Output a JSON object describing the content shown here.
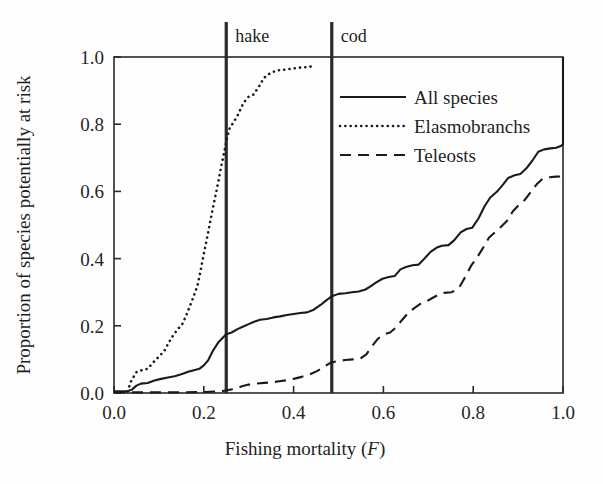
{
  "chart_data": {
    "type": "line",
    "title": "",
    "xlabel": "Fishing mortality (F)",
    "ylabel": "Proportion of species potentially at risk",
    "xlim": [
      0.0,
      1.0
    ],
    "ylim": [
      0.0,
      1.0
    ],
    "grid": false,
    "legend_position": "upper-right-inside",
    "xticks": [
      "0.0",
      "0.2",
      "0.4",
      "0.6",
      "0.8",
      "1.0"
    ],
    "xtick_values": [
      0.0,
      0.2,
      0.4,
      0.6,
      0.8,
      1.0
    ],
    "yticks": [
      "0.0",
      "0.2",
      "0.4",
      "0.6",
      "0.8",
      "1.0"
    ],
    "ytick_values": [
      0.0,
      0.2,
      0.4,
      0.6,
      0.8,
      1.0
    ],
    "annotations": [
      {
        "label": "hake",
        "x": 0.25,
        "type": "vertical-reference-line",
        "color": "#2b2b2b"
      },
      {
        "label": "cod",
        "x": 0.485,
        "type": "vertical-reference-line",
        "color": "#2b2b2b"
      }
    ],
    "series": [
      {
        "name": "All species",
        "style": "solid",
        "color": "#1a1a1a",
        "points": [
          [
            0.0,
            0.005
          ],
          [
            0.03,
            0.005
          ],
          [
            0.04,
            0.01
          ],
          [
            0.05,
            0.022
          ],
          [
            0.06,
            0.028
          ],
          [
            0.075,
            0.03
          ],
          [
            0.09,
            0.037
          ],
          [
            0.105,
            0.042
          ],
          [
            0.12,
            0.046
          ],
          [
            0.135,
            0.05
          ],
          [
            0.15,
            0.056
          ],
          [
            0.165,
            0.063
          ],
          [
            0.178,
            0.068
          ],
          [
            0.19,
            0.072
          ],
          [
            0.2,
            0.082
          ],
          [
            0.21,
            0.098
          ],
          [
            0.22,
            0.125
          ],
          [
            0.232,
            0.15
          ],
          [
            0.245,
            0.168
          ],
          [
            0.25,
            0.175
          ],
          [
            0.262,
            0.18
          ],
          [
            0.275,
            0.19
          ],
          [
            0.288,
            0.198
          ],
          [
            0.3,
            0.205
          ],
          [
            0.312,
            0.212
          ],
          [
            0.325,
            0.218
          ],
          [
            0.34,
            0.22
          ],
          [
            0.355,
            0.225
          ],
          [
            0.37,
            0.228
          ],
          [
            0.385,
            0.232
          ],
          [
            0.4,
            0.235
          ],
          [
            0.415,
            0.238
          ],
          [
            0.43,
            0.24
          ],
          [
            0.445,
            0.248
          ],
          [
            0.46,
            0.262
          ],
          [
            0.472,
            0.275
          ],
          [
            0.485,
            0.288
          ],
          [
            0.5,
            0.295
          ],
          [
            0.515,
            0.297
          ],
          [
            0.53,
            0.3
          ],
          [
            0.545,
            0.302
          ],
          [
            0.56,
            0.308
          ],
          [
            0.572,
            0.318
          ],
          [
            0.585,
            0.33
          ],
          [
            0.598,
            0.34
          ],
          [
            0.612,
            0.345
          ],
          [
            0.625,
            0.348
          ],
          [
            0.638,
            0.368
          ],
          [
            0.65,
            0.375
          ],
          [
            0.665,
            0.38
          ],
          [
            0.678,
            0.382
          ],
          [
            0.69,
            0.398
          ],
          [
            0.705,
            0.42
          ],
          [
            0.718,
            0.432
          ],
          [
            0.73,
            0.438
          ],
          [
            0.745,
            0.44
          ],
          [
            0.758,
            0.455
          ],
          [
            0.772,
            0.478
          ],
          [
            0.785,
            0.488
          ],
          [
            0.798,
            0.492
          ],
          [
            0.812,
            0.52
          ],
          [
            0.825,
            0.555
          ],
          [
            0.838,
            0.582
          ],
          [
            0.852,
            0.598
          ],
          [
            0.865,
            0.618
          ],
          [
            0.878,
            0.64
          ],
          [
            0.892,
            0.648
          ],
          [
            0.905,
            0.652
          ],
          [
            0.918,
            0.668
          ],
          [
            0.932,
            0.692
          ],
          [
            0.945,
            0.718
          ],
          [
            0.958,
            0.725
          ],
          [
            0.972,
            0.728
          ],
          [
            0.985,
            0.73
          ],
          [
            0.995,
            0.735
          ],
          [
            1.0,
            0.74
          ],
          [
            1.0,
            1.0
          ]
        ]
      },
      {
        "name": "Elasmobranchs",
        "style": "dotted",
        "color": "#1a1a1a",
        "points": [
          [
            0.03,
            0.005
          ],
          [
            0.038,
            0.035
          ],
          [
            0.05,
            0.062
          ],
          [
            0.062,
            0.068
          ],
          [
            0.075,
            0.072
          ],
          [
            0.088,
            0.092
          ],
          [
            0.1,
            0.108
          ],
          [
            0.112,
            0.125
          ],
          [
            0.122,
            0.15
          ],
          [
            0.132,
            0.172
          ],
          [
            0.142,
            0.19
          ],
          [
            0.152,
            0.205
          ],
          [
            0.16,
            0.228
          ],
          [
            0.17,
            0.262
          ],
          [
            0.178,
            0.29
          ],
          [
            0.186,
            0.32
          ],
          [
            0.192,
            0.358
          ],
          [
            0.198,
            0.4
          ],
          [
            0.204,
            0.44
          ],
          [
            0.21,
            0.48
          ],
          [
            0.216,
            0.522
          ],
          [
            0.222,
            0.562
          ],
          [
            0.228,
            0.6
          ],
          [
            0.234,
            0.64
          ],
          [
            0.24,
            0.682
          ],
          [
            0.246,
            0.72
          ],
          [
            0.252,
            0.76
          ],
          [
            0.258,
            0.79
          ],
          [
            0.266,
            0.805
          ],
          [
            0.276,
            0.828
          ],
          [
            0.288,
            0.862
          ],
          [
            0.298,
            0.88
          ],
          [
            0.31,
            0.888
          ],
          [
            0.322,
            0.91
          ],
          [
            0.334,
            0.938
          ],
          [
            0.348,
            0.952
          ],
          [
            0.362,
            0.96
          ],
          [
            0.378,
            0.962
          ],
          [
            0.395,
            0.965
          ],
          [
            0.412,
            0.968
          ],
          [
            0.43,
            0.97
          ],
          [
            0.442,
            0.972
          ]
        ]
      },
      {
        "name": "Teleosts",
        "style": "dashed",
        "color": "#1a1a1a",
        "points": [
          [
            0.0,
            0.002
          ],
          [
            0.15,
            0.002
          ],
          [
            0.2,
            0.003
          ],
          [
            0.24,
            0.005
          ],
          [
            0.25,
            0.008
          ],
          [
            0.268,
            0.012
          ],
          [
            0.285,
            0.02
          ],
          [
            0.3,
            0.025
          ],
          [
            0.318,
            0.028
          ],
          [
            0.335,
            0.03
          ],
          [
            0.352,
            0.032
          ],
          [
            0.368,
            0.035
          ],
          [
            0.385,
            0.038
          ],
          [
            0.4,
            0.042
          ],
          [
            0.418,
            0.048
          ],
          [
            0.435,
            0.055
          ],
          [
            0.452,
            0.065
          ],
          [
            0.468,
            0.078
          ],
          [
            0.482,
            0.09
          ],
          [
            0.498,
            0.095
          ],
          [
            0.515,
            0.098
          ],
          [
            0.532,
            0.1
          ],
          [
            0.548,
            0.102
          ],
          [
            0.562,
            0.115
          ],
          [
            0.575,
            0.14
          ],
          [
            0.588,
            0.162
          ],
          [
            0.602,
            0.175
          ],
          [
            0.615,
            0.18
          ],
          [
            0.628,
            0.195
          ],
          [
            0.642,
            0.218
          ],
          [
            0.655,
            0.238
          ],
          [
            0.668,
            0.252
          ],
          [
            0.682,
            0.265
          ],
          [
            0.695,
            0.272
          ],
          [
            0.708,
            0.282
          ],
          [
            0.722,
            0.292
          ],
          [
            0.735,
            0.298
          ],
          [
            0.752,
            0.3
          ],
          [
            0.768,
            0.312
          ],
          [
            0.782,
            0.345
          ],
          [
            0.795,
            0.378
          ],
          [
            0.808,
            0.402
          ],
          [
            0.822,
            0.432
          ],
          [
            0.835,
            0.462
          ],
          [
            0.848,
            0.478
          ],
          [
            0.862,
            0.495
          ],
          [
            0.875,
            0.512
          ],
          [
            0.888,
            0.54
          ],
          [
            0.902,
            0.56
          ],
          [
            0.915,
            0.575
          ],
          [
            0.928,
            0.598
          ],
          [
            0.942,
            0.622
          ],
          [
            0.955,
            0.638
          ],
          [
            0.97,
            0.642
          ],
          [
            0.985,
            0.644
          ],
          [
            1.0,
            0.645
          ]
        ]
      }
    ]
  },
  "axes": {
    "xlabel_main": "Fishing mortality (",
    "xlabel_italic": "F",
    "xlabel_close": ")",
    "ylabel": "Proportion of species potentially at risk"
  },
  "legend": {
    "items": [
      {
        "label": "All species",
        "style": "solid"
      },
      {
        "label": "Elasmobranchs",
        "style": "dotted"
      },
      {
        "label": "Teleosts",
        "style": "dashed"
      }
    ]
  },
  "reference_lines": [
    {
      "label": "hake",
      "x": 0.25
    },
    {
      "label": "cod",
      "x": 0.485
    }
  ],
  "colors": {
    "ink": "#1a1a1a",
    "reference_line": "#2b2b2b",
    "background": "#fefefe"
  }
}
